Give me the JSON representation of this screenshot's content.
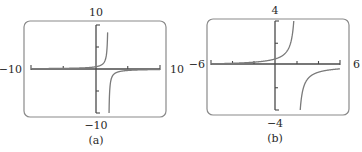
{
  "chart_data": [
    {
      "type": "line",
      "panel_label": "(a)",
      "function_shape": "rational, vertical asymptote near x = 2, horizontal asymptote y = 0",
      "xlim": [
        -10,
        10
      ],
      "ylim": [
        -10,
        10
      ],
      "x_tick_step": 5,
      "y_tick_step": 5,
      "labels": {
        "xmin": "−10",
        "xmax": "10",
        "ymin": "−10",
        "ymax": "10"
      },
      "asymptote_x": 2,
      "k": 1,
      "grid": false,
      "line_color": "#7a7a7a",
      "axis_color": "#4a4a4a",
      "frame_color": "#8a8a8a"
    },
    {
      "type": "line",
      "panel_label": "(b)",
      "function_shape": "rational, vertical asymptote near x = 2, horizontal asymptote y = 0",
      "xlim": [
        -6,
        6
      ],
      "ylim": [
        -4,
        4
      ],
      "x_tick_step": 2,
      "y_tick_step": 2,
      "labels": {
        "xmin": "−6",
        "xmax": "6",
        "ymin": "−4",
        "ymax": "4"
      },
      "asymptote_x": 2,
      "k": 1.2,
      "grid": false,
      "line_color": "#7a7a7a",
      "axis_color": "#4a4a4a",
      "frame_color": "#8a8a8a"
    }
  ],
  "layout": {
    "panels": [
      {
        "frame": [
          24,
          21,
          142,
          96
        ],
        "plot": [
          31,
          25,
          160,
          113
        ],
        "xaxis_y": 69,
        "yaxis_x": 96
      },
      {
        "frame": [
          207,
          19,
          142,
          96
        ],
        "plot": [
          211,
          21,
          340,
          110
        ],
        "xaxis_y": 64,
        "yaxis_x": 275
      }
    ]
  }
}
